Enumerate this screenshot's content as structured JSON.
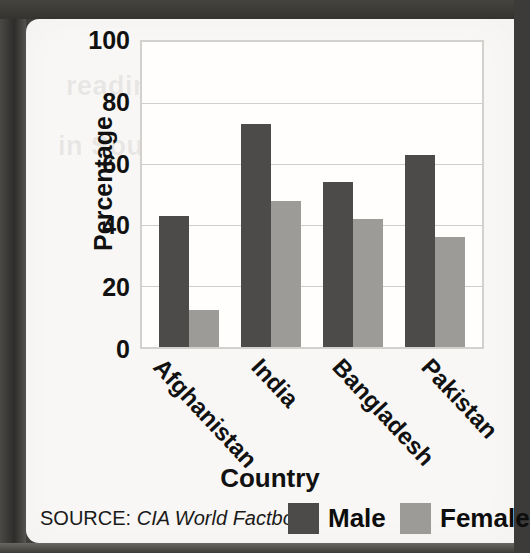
{
  "page": {
    "paper_color": "#f8f7f5",
    "border_color": "#3a3937"
  },
  "chart_data": {
    "type": "bar",
    "title": "",
    "xlabel": "Country",
    "ylabel": "Percentage",
    "ylim": [
      0,
      100
    ],
    "yticks": [
      "100",
      "80",
      "60",
      "40",
      "20",
      "0"
    ],
    "ytick_values": [
      100,
      80,
      60,
      40,
      20,
      0
    ],
    "grid": true,
    "legend_position": "bottom-right",
    "categories": [
      "Afghanistan",
      "India",
      "Bangladesh",
      "Pakistan"
    ],
    "series": [
      {
        "name": "Male",
        "color": "#4c4b4a",
        "values": [
          43,
          73,
          54,
          63
        ]
      },
      {
        "name": "Female",
        "color": "#9c9b98",
        "values": [
          12,
          48,
          42,
          36
        ]
      }
    ]
  },
  "footer": {
    "source_label": "SOURCE:",
    "source_title": "CIA World Factbook",
    "legend": [
      {
        "label": "Male",
        "color": "#4c4b4a"
      },
      {
        "label": "Female",
        "color": "#9c9b98"
      }
    ]
  },
  "ghost_text": {
    "line1": "reading literacy",
    "line2": "in South Asia"
  }
}
